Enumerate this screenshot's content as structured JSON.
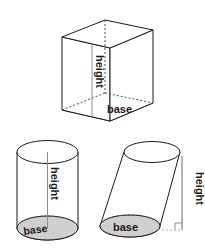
{
  "figure": {
    "background_color": "#ffffff",
    "outline_color": "#1a1a1a",
    "base_fill_color": "#cfcfcf",
    "hidden_edge_color": "#4d4d4d",
    "measure_line_color": "#8c8c8c",
    "solids": [
      {
        "id": "rectangular-prism",
        "name": "rectangular prism",
        "position": "top",
        "height_label": "height",
        "base_label": "base",
        "height_label_rotation": 90,
        "base_label_rotation": 0
      },
      {
        "id": "right-cylinder",
        "name": "right cylinder",
        "position": "bottom-left",
        "height_label": "height",
        "base_label": "base",
        "height_label_rotation": 90,
        "base_label_rotation": -8
      },
      {
        "id": "oblique-cylinder",
        "name": "oblique cylinder",
        "position": "bottom-right",
        "height_label": "height",
        "base_label": "base",
        "height_label_rotation": 90,
        "base_label_rotation": 0,
        "right_angle_marker": true
      }
    ]
  }
}
